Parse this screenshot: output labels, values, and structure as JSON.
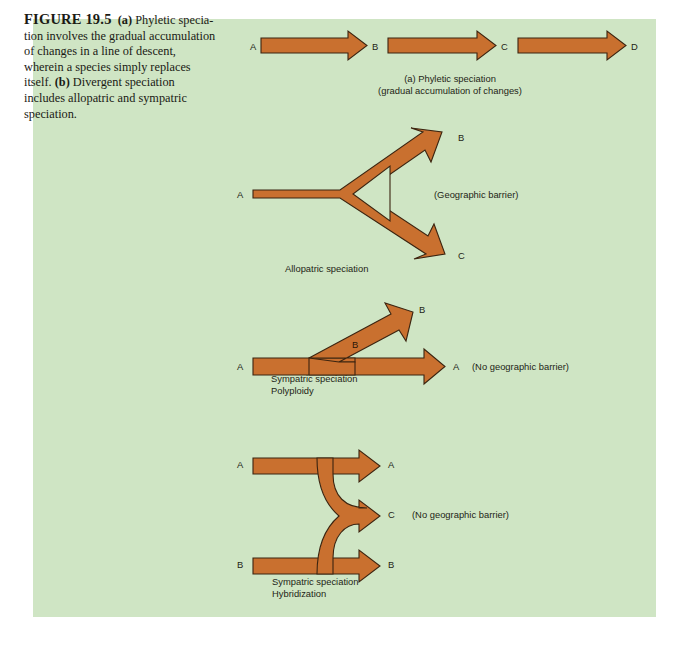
{
  "figure": {
    "number": "FIGURE 19.5",
    "caption_parts": {
      "a_marker": "(a)",
      "a_text": " Phyletic specia­tion involves the gradual accumulation of changes in a line of descent, wherein a species simply replaces itself. ",
      "b_marker": "(b)",
      "b_text": " Diver­gent speciation includes allopatric and sympatric speciation."
    },
    "caption_full": "FIGURE 19.5 (a) Phyletic speciation involves the gradual accumulation of changes in a line of descent, wherein a species simply replaces itself. (b) Divergent speciation includes allopatric and sympatric speciation.",
    "panel_color": "#cfe5c4",
    "arrow_color": "#c9702f",
    "arrow_outline_color": "#3b2410"
  },
  "panel_a": {
    "caption_line1": "(a) Phyletic speciation",
    "caption_line1_marker": "(a)",
    "caption_line1_rest": " Phyletic speciation",
    "caption_line2": "(gradual accumulation of changes)",
    "arrows": [
      {
        "start_label": "A",
        "end_label": "B"
      },
      {
        "start_label": "B",
        "end_label": "C"
      },
      {
        "start_label": "C",
        "end_label": "D"
      }
    ],
    "labels": {
      "a": "A",
      "b": "B",
      "c": "C",
      "d": "D"
    }
  },
  "panel_allopatric": {
    "title": "Allopatric speciation",
    "start_label": "A",
    "upper_end_label": "B",
    "lower_end_label": "C",
    "barrier_note": "(Geographic barrier)"
  },
  "panel_polyploidy": {
    "title_line1": "Sympatric speciation",
    "title_line2": "Polyploidy",
    "start_label": "A",
    "upper_end_label": "B",
    "lower_end_label": "A",
    "branch_inner_label": "B",
    "barrier_note": "(No geographic barrier)"
  },
  "panel_hybridization": {
    "title_line1": "Sympatric speciation",
    "title_line2": "Hybridization",
    "top_start_label": "A",
    "bottom_start_label": "B",
    "top_end_label": "A",
    "middle_end_label": "C",
    "bottom_end_label": "B",
    "barrier_note": "(No geographic barrier)"
  }
}
